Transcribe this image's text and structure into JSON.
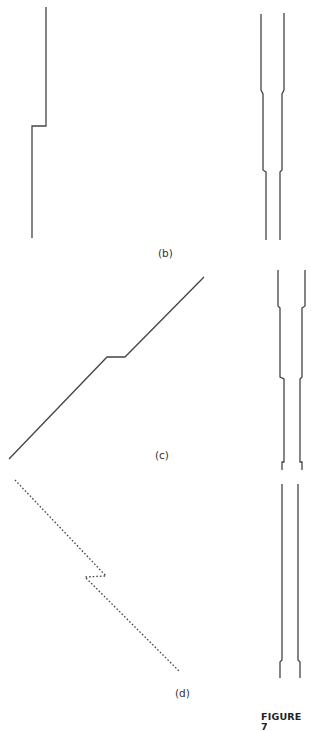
{
  "figure": {
    "caption": "FIGURE 7",
    "line_color": "#444444",
    "panels": [
      {
        "id": "b",
        "label": "(b)"
      },
      {
        "id": "c",
        "label": "(c)"
      },
      {
        "id": "d",
        "label": "(d)"
      }
    ]
  }
}
